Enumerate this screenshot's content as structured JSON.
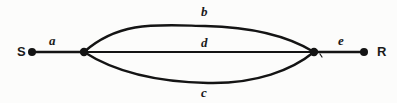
{
  "figure": {
    "type": "graph-diagram",
    "stroke_color": "#141414",
    "background_color": "#fcfcfb"
  },
  "nodes": [
    {
      "id": "S",
      "label": "S",
      "x": 32,
      "y": 52,
      "terminal": true,
      "dot": true
    },
    {
      "id": "n1",
      "label": "",
      "x": 84,
      "y": 52,
      "terminal": false,
      "dot": true
    },
    {
      "id": "n2",
      "label": "",
      "x": 314,
      "y": 52,
      "terminal": false,
      "dot": true
    },
    {
      "id": "R",
      "label": "R",
      "x": 364,
      "y": 52,
      "terminal": true,
      "dot": true
    }
  ],
  "edges": [
    {
      "id": "a",
      "label": "a",
      "from": "S",
      "to": "n1",
      "shape": "straight"
    },
    {
      "id": "b",
      "label": "b",
      "from": "n1",
      "to": "n2",
      "shape": "arc-up"
    },
    {
      "id": "d",
      "label": "d",
      "from": "n1",
      "to": "n2",
      "shape": "straight"
    },
    {
      "id": "c",
      "label": "c",
      "from": "n1",
      "to": "n2",
      "shape": "arc-down"
    },
    {
      "id": "e",
      "label": "e",
      "from": "n2",
      "to": "R",
      "shape": "straight"
    }
  ],
  "labels": {
    "source": "S",
    "receiver": "R",
    "edge_a": "a",
    "edge_b": "b",
    "edge_c": "c",
    "edge_d": "d",
    "edge_e": "e"
  }
}
